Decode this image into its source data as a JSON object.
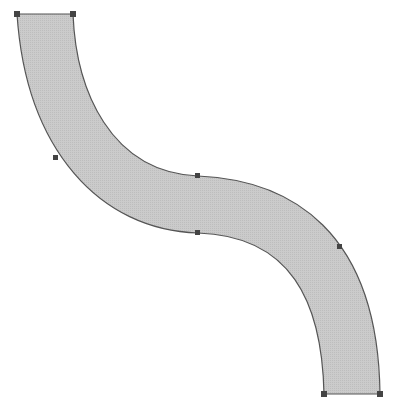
{
  "shape": {
    "type": "s-curve-band",
    "fill": "#c8c8c8",
    "stroke": "#555555",
    "handle_color": "#444444"
  },
  "handles": [
    {
      "name": "top-left",
      "x": 17,
      "y": 14
    },
    {
      "name": "top-right",
      "x": 73,
      "y": 14
    },
    {
      "name": "left-mid",
      "x": 56,
      "y": 158
    },
    {
      "name": "upper-center",
      "x": 198,
      "y": 176
    },
    {
      "name": "lower-center",
      "x": 198,
      "y": 233
    },
    {
      "name": "right-mid",
      "x": 340,
      "y": 247
    },
    {
      "name": "bottom-left",
      "x": 324,
      "y": 394
    },
    {
      "name": "bottom-right",
      "x": 380,
      "y": 394
    }
  ]
}
